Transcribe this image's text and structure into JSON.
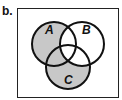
{
  "diagram": {
    "part_label": "b.",
    "type": "venn-3-set",
    "sets": [
      {
        "name": "A",
        "cx": 54,
        "cy": 44,
        "r": 22
      },
      {
        "name": "B",
        "cx": 82,
        "cy": 44,
        "r": 22
      },
      {
        "name": "C",
        "cx": 68,
        "cy": 67,
        "r": 22
      }
    ],
    "shaded_region": "(A ∪ C) ∩ B'",
    "shaded_regions": [
      "A only",
      "A∩C only",
      "C only"
    ],
    "colors": {
      "shade": "#c8c8c8",
      "stroke": "#111111",
      "background": "#ffffff"
    }
  }
}
